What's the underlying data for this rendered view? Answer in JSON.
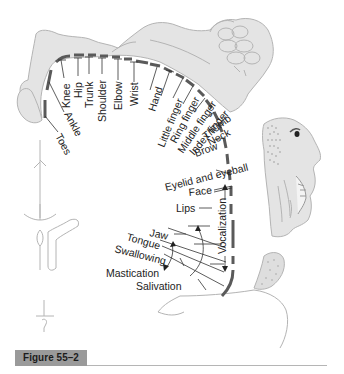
{
  "figure": {
    "caption": "Figure 55–2",
    "colors": {
      "body_fill": "#e4e4e4",
      "body_outline": "#b4b4b4",
      "cortex_band": "#5a5a5a",
      "label_text": "#222222",
      "caption_bg": "#9a9a9a"
    }
  },
  "homunculus": {
    "labels": [
      "Toes",
      "Ankle",
      "Knee",
      "Hip",
      "Trunk",
      "Shoulder",
      "Elbow",
      "Wrist",
      "Hand",
      "Little finger",
      "Ring finger",
      "Middle finger",
      "Index finger",
      "Thumb",
      "Neck",
      "Brow",
      "Eyelid and eyeball",
      "Face",
      "Lips",
      "Jaw",
      "Tongue",
      "Swallowing",
      "Mastication",
      "Salivation",
      "Vocalization"
    ]
  }
}
